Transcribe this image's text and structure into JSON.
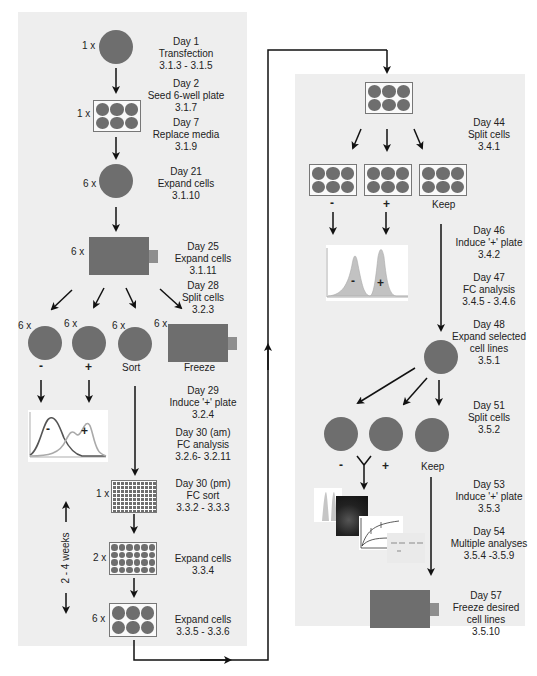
{
  "left_panel": {
    "steps": [
      {
        "day": "Day 1",
        "action": "Transfection",
        "ref": "3.1.3 - 3.1.5"
      },
      {
        "day": "Day 2",
        "action": "Seed 6-well plate",
        "ref": "3.1.7"
      },
      {
        "day": "Day 7",
        "action": "Replace media",
        "ref": "3.1.9"
      },
      {
        "day": "Day 21",
        "action": "Expand cells",
        "ref": "3.1.10"
      },
      {
        "day": "Day 25",
        "action": "Expand cells",
        "ref": "3.1.11"
      },
      {
        "day": "Day 28",
        "action": "Split cells",
        "ref": "3.2.3"
      },
      {
        "day": "Day 29",
        "action": "Induce '+' plate",
        "ref": "3.2.4"
      },
      {
        "day": "Day 30 (am)",
        "action": "FC analysis",
        "ref": "3.2.6- 3.2.11"
      },
      {
        "day": "Day 30 (pm)",
        "action": "FC sort",
        "ref": "3.3.2 - 3.3.3"
      },
      {
        "day": "",
        "action": "Expand cells",
        "ref": "3.3.4"
      },
      {
        "day": "",
        "action": "Expand cells",
        "ref": "3.3.5 - 3.3.6"
      }
    ],
    "multipliers": {
      "dish1": "1 x",
      "plate6": "1 x",
      "dish2": "6 x",
      "flask": "6 x",
      "split_minus": "6 x",
      "split_plus": "6 x",
      "split_sort": "6 x",
      "split_freeze": "6 x",
      "plate96": "1 x",
      "plate24": "2 x",
      "plate6b": "6 x"
    },
    "branch_labels": {
      "minus": "-",
      "plus": "+",
      "sort": "Sort",
      "freeze": "Freeze"
    },
    "histogram_labels": {
      "minus": "-",
      "plus": "+"
    },
    "duration": "2 - 4 weeks"
  },
  "right_panel": {
    "steps": [
      {
        "day": "Day 44",
        "action": "Split cells",
        "ref": "3.4.1"
      },
      {
        "day": "Day 46",
        "action": "Induce '+' plate",
        "ref": "3.4.2"
      },
      {
        "day": "Day 47",
        "action": "FC analysis",
        "ref": "3.4.5 - 3.4.6"
      },
      {
        "day": "Day 48",
        "action": "Expand selected",
        "action2": "cell lines",
        "ref": "3.5.1"
      },
      {
        "day": "Day 51",
        "action": "Split cells",
        "ref": "3.5.2"
      },
      {
        "day": "Day 53",
        "action": "Induce '+' plate",
        "ref": "3.5.3"
      },
      {
        "day": "Day 54",
        "action": "Multiple analyses",
        "ref": "3.5.4 -3.5.9"
      },
      {
        "day": "Day 57",
        "action": "Freeze desired",
        "action2": "cell lines",
        "ref": "3.5.10"
      }
    ],
    "plate_labels": {
      "minus": "-",
      "plus": "+",
      "keep": "Keep"
    },
    "histogram_labels": {
      "minus": "-",
      "plus": "+"
    },
    "split_labels": {
      "minus": "-",
      "plus": "+",
      "keep": "Keep"
    }
  },
  "colors": {
    "panel_bg": "#eeeeee",
    "vessel": "#6e6e6e",
    "flask_tab": "#8e8e8e",
    "arrow": "#111111"
  }
}
